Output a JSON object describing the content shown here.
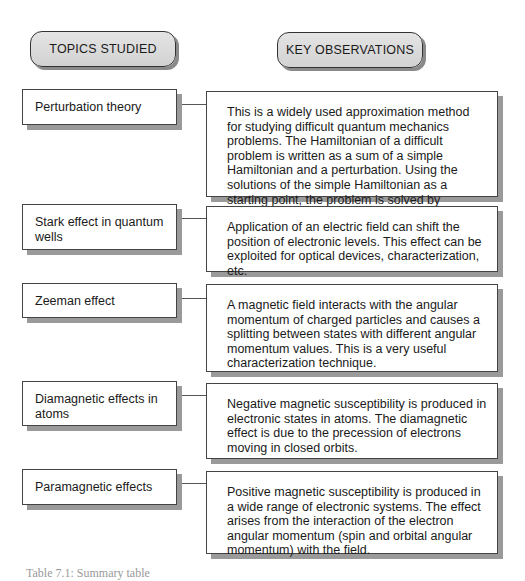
{
  "headers": {
    "topics": "TOPICS STUDIED",
    "observations": "KEY OBSERVATIONS"
  },
  "rows": [
    {
      "topic": "Perturbation theory",
      "observation": "This is a widely used approximation method for studying difficult quantum mechanics problems. The Hamiltonian of a difficult problem is written as a sum of a simple Hamiltonian and a perturbation. Using the solutions of the simple Hamiltonian as a starting point, the problem is solved by calculating corrections to different orders."
    },
    {
      "topic": "Stark effect in quantum wells",
      "observation": "Application of an electric field can shift the position of electronic levels. This effect can be exploited for optical devices, characterization, etc."
    },
    {
      "topic": "Zeeman effect",
      "observation": "A magnetic field interacts with the angular momentum of charged particles and causes a splitting between states with different angular momentum values. This is a very useful characterization technique."
    },
    {
      "topic": "Diamagnetic effects in atoms",
      "observation": "Negative magnetic susceptibility is produced in electronic states in atoms. The diamagnetic effect is due to the precession of electrons moving in closed orbits."
    },
    {
      "topic": "Paramagnetic effects",
      "observation": "Positive magnetic susceptibility is produced in a wide range of electronic systems. The effect arises from the interaction of the electron angular momentum (spin and orbital angular momentum) with the field."
    }
  ],
  "caption": "Table 7.1: Summary table"
}
